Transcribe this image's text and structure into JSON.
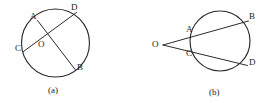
{
  "figure": {
    "type": "geometry-diagram",
    "stroke_color": "#2b2b2b",
    "text_color": "#222222",
    "background_color": "#ffffff",
    "panels": [
      {
        "id": "panel-a",
        "caption": "(a)",
        "caption_pos": {
          "x": 48,
          "y": 86
        },
        "circle": {
          "cx": 55.5,
          "cy": 43,
          "r": 34
        },
        "center_point": {
          "label": "O",
          "x": 48,
          "y": 41
        },
        "points": [
          {
            "label": "A",
            "x": 30,
            "y": 12,
            "mark_x": 37.5,
            "mark_y": 20.5
          },
          {
            "label": "D",
            "x": 71,
            "y": 3,
            "mark_x": 76.5,
            "mark_y": 12.5
          },
          {
            "label": "C",
            "x": 15,
            "y": 44,
            "mark_x": 23.5,
            "mark_y": 51.5
          },
          {
            "label": "B",
            "x": 77,
            "y": 63,
            "mark_x": 75.5,
            "mark_y": 70.0
          }
        ],
        "chords": [
          {
            "name": "chord-AB",
            "from": "A",
            "to": "B"
          },
          {
            "name": "chord-CD",
            "from": "C",
            "to": "D"
          }
        ]
      },
      {
        "id": "panel-b",
        "caption": "(b)",
        "caption_pos": {
          "x": 209,
          "y": 88
        },
        "circle": {
          "cx": 220,
          "cy": 41,
          "r": 30
        },
        "external_point": {
          "label": "O",
          "x": 152,
          "y": 40,
          "vertex_x": 163,
          "vertex_y": 45
        },
        "points": [
          {
            "label": "A",
            "x": 186,
            "y": 25,
            "mark_x": 195.5,
            "mark_y": 33.5
          },
          {
            "label": "B",
            "x": 249,
            "y": 12,
            "mark_x": 247.0,
            "mark_y": 22.0
          },
          {
            "label": "C",
            "x": 186,
            "y": 49,
            "mark_x": 194.0,
            "mark_y": 55.5
          },
          {
            "label": "D",
            "x": 249,
            "y": 58,
            "mark_x": 246.5,
            "mark_y": 65.5
          }
        ],
        "secants": [
          {
            "name": "secant-OAB",
            "from": "O",
            "through": "A",
            "to": "B"
          },
          {
            "name": "secant-OCD",
            "from": "O",
            "through": "C",
            "to": "D"
          }
        ]
      }
    ]
  }
}
